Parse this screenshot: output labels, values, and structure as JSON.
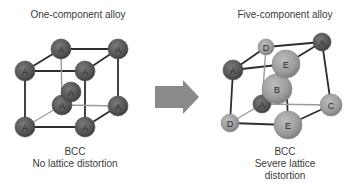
{
  "left_panel": {
    "title": "One-component alloy",
    "caption_line1": "BCC",
    "caption_line2": "No lattice distortion",
    "atoms": [
      {
        "id": "btl",
        "label": "A",
        "x": 61,
        "y": 49,
        "r": 10,
        "type": "dark"
      },
      {
        "id": "btr",
        "label": "A",
        "x": 118,
        "y": 49,
        "r": 10,
        "type": "dark"
      },
      {
        "id": "bbl",
        "label": "A",
        "x": 62,
        "y": 105,
        "r": 10,
        "type": "dark"
      },
      {
        "id": "bbr",
        "label": "A",
        "x": 118,
        "y": 106,
        "r": 10,
        "type": "dark"
      },
      {
        "id": "center",
        "label": "A",
        "x": 71,
        "y": 92,
        "r": 10,
        "type": "dark"
      },
      {
        "id": "ftl",
        "label": "A",
        "x": 25,
        "y": 71,
        "r": 10,
        "type": "dark"
      },
      {
        "id": "ftr",
        "label": "A",
        "x": 85,
        "y": 71,
        "r": 10,
        "type": "dark"
      },
      {
        "id": "fbl",
        "label": "A",
        "x": 25,
        "y": 127,
        "r": 10,
        "type": "dark"
      },
      {
        "id": "fbr",
        "label": "A",
        "x": 85,
        "y": 127,
        "r": 10,
        "type": "dark"
      }
    ]
  },
  "right_panel": {
    "title": "Five-component alloy",
    "caption_line1": "BCC",
    "caption_line2": "Severe lattice",
    "caption_line3": "distortion",
    "atoms": [
      {
        "id": "btl",
        "label": "D",
        "x": 266,
        "y": 47,
        "r": 8,
        "type": "light"
      },
      {
        "id": "btr",
        "label": "A",
        "x": 322,
        "y": 42,
        "r": 9,
        "type": "dark"
      },
      {
        "id": "bbl",
        "label": "A",
        "x": 262,
        "y": 104,
        "r": 9,
        "type": "dark"
      },
      {
        "id": "bbr",
        "label": "C",
        "x": 331,
        "y": 105,
        "r": 11,
        "type": "light"
      },
      {
        "id": "center",
        "label": "B",
        "x": 277,
        "y": 89,
        "r": 15,
        "type": "light"
      },
      {
        "id": "ftl",
        "label": "A",
        "x": 233,
        "y": 70,
        "r": 10,
        "type": "dark"
      },
      {
        "id": "ftr",
        "label": "E",
        "x": 286,
        "y": 64,
        "r": 14,
        "type": "light"
      },
      {
        "id": "fbl",
        "label": "D",
        "x": 230,
        "y": 123,
        "r": 9,
        "type": "light"
      },
      {
        "id": "fbr",
        "label": "E",
        "x": 288,
        "y": 125,
        "r": 14,
        "type": "light"
      }
    ]
  },
  "arrow": {
    "direction": "right",
    "color": "#8a8a8a"
  },
  "colors": {
    "dark_atom": "#5c5c5c",
    "light_atom": "#a2a2a2",
    "edge": "#2e2e2e",
    "back_edge": "#9a9a9a",
    "text": "#3a3a3a"
  }
}
